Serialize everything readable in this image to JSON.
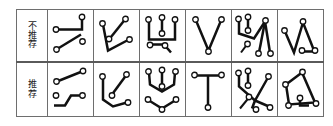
{
  "figure": {
    "kind": "comparison-table",
    "rows": 2,
    "columns": 7,
    "stroke_color": "#111111",
    "node_fill_color": "#ffffff",
    "border_color": "#6e6e6e",
    "background_color": "#ffffff"
  },
  "rows": [
    {
      "id": "not-recommended",
      "label_chars": [
        "不",
        "推",
        "荐"
      ],
      "label_text": "不推荐",
      "cells": [
        {
          "id": "nr-1",
          "name": "diagram-zigzag-with-stub"
        },
        {
          "id": "nr-2",
          "name": "diagram-check-mark"
        },
        {
          "id": "nr-3",
          "name": "diagram-u-shape-with-drop"
        },
        {
          "id": "nr-4",
          "name": "diagram-v-shape"
        },
        {
          "id": "nr-5",
          "name": "diagram-double-peak-cluster"
        },
        {
          "id": "nr-6",
          "name": "diagram-peak-with-baseline"
        }
      ]
    },
    {
      "id": "recommended",
      "label_chars": [
        "推",
        "荐"
      ],
      "label_text": "推荐",
      "cells": [
        {
          "id": "r-1",
          "name": "diagram-step-with-slope"
        },
        {
          "id": "r-2",
          "name": "diagram-hook-with-slope"
        },
        {
          "id": "r-3",
          "name": "diagram-double-cup"
        },
        {
          "id": "r-4",
          "name": "diagram-tee-shape"
        },
        {
          "id": "r-5",
          "name": "diagram-branching-arms"
        },
        {
          "id": "r-6",
          "name": "diagram-closed-polygon"
        }
      ]
    }
  ]
}
